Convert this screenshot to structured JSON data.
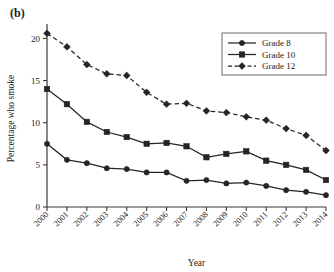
{
  "figure": {
    "panel_label": "(b)"
  },
  "chart_data": {
    "type": "line",
    "title": "",
    "xlabel": "Year",
    "ylabel": "Percentage who smoke",
    "categories": [
      "2000",
      "2001",
      "2002",
      "2003",
      "2004",
      "2005",
      "2006",
      "2007",
      "2008",
      "2009",
      "2010",
      "2011",
      "2012",
      "2013",
      "2014"
    ],
    "x": [
      2000,
      2001,
      2002,
      2003,
      2004,
      2005,
      2006,
      2007,
      2008,
      2009,
      2010,
      2011,
      2012,
      2013,
      2014
    ],
    "xlim": [
      2000,
      2014
    ],
    "ylim": [
      0,
      21
    ],
    "yticks": [
      0,
      5,
      10,
      15,
      20
    ],
    "ytick_labels": [
      "0",
      "5",
      "10",
      "15",
      "20"
    ],
    "grid": false,
    "legend_position": "top-right",
    "series": [
      {
        "name": "Grade 8",
        "marker": "circle",
        "linestyle": "solid",
        "color": "#252525",
        "values": [
          7.5,
          5.6,
          5.2,
          4.6,
          4.5,
          4.1,
          4.1,
          3.1,
          3.2,
          2.8,
          2.9,
          2.5,
          2.0,
          1.8,
          1.4
        ]
      },
      {
        "name": "Grade 10",
        "marker": "square",
        "linestyle": "solid",
        "color": "#252525",
        "values": [
          14.0,
          12.2,
          10.1,
          8.9,
          8.3,
          7.5,
          7.6,
          7.2,
          5.9,
          6.3,
          6.6,
          5.5,
          5.0,
          4.4,
          3.2
        ]
      },
      {
        "name": "Grade 12",
        "marker": "diamond",
        "linestyle": "dashed",
        "color": "#252525",
        "values": [
          20.6,
          19.0,
          16.9,
          15.8,
          15.6,
          13.6,
          12.2,
          12.3,
          11.4,
          11.2,
          10.7,
          10.3,
          9.3,
          8.5,
          6.7
        ]
      }
    ]
  }
}
